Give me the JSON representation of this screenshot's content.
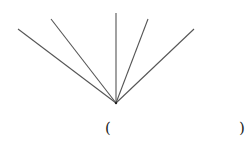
{
  "diagram": {
    "origin": {
      "x": 116,
      "y": 103
    },
    "line_color": "#555555",
    "rays": [
      {
        "x": 18,
        "y": 29
      },
      {
        "x": 51,
        "y": 19
      },
      {
        "x": 116,
        "y": 13
      },
      {
        "x": 148,
        "y": 19
      },
      {
        "x": 194,
        "y": 29
      }
    ],
    "answer_blank": {
      "open": "(",
      "close": ")"
    }
  }
}
